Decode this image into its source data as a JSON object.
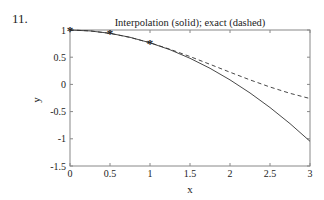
{
  "problem_number": "11.",
  "chart_data": {
    "type": "line",
    "title": "Interpolation (solid); exact (dashed)",
    "xlabel": "x",
    "ylabel": "y",
    "xlim": [
      0,
      3
    ],
    "ylim": [
      -1.5,
      1
    ],
    "xticks": [
      "0",
      "0.5",
      "1",
      "1.5",
      "2",
      "2.5",
      "3"
    ],
    "yticks": [
      "1",
      "0.5",
      "0",
      "-0.5",
      "-1",
      "-1.5"
    ],
    "grid": false,
    "series": [
      {
        "name": "Interpolation",
        "style": "solid",
        "x": [
          0,
          0.25,
          0.5,
          0.75,
          1,
          1.25,
          1.5,
          1.75,
          2,
          2.25,
          2.5,
          2.75,
          3
        ],
        "y": [
          1,
          0.983,
          0.939,
          0.866,
          0.765,
          0.637,
          0.48,
          0.296,
          0.083,
          -0.157,
          -0.425,
          -0.721,
          -1.046
        ]
      },
      {
        "name": "Exact",
        "style": "dashed",
        "x": [
          0,
          0.25,
          0.5,
          0.75,
          1,
          1.25,
          1.5,
          1.75,
          2,
          2.25,
          2.5,
          2.75,
          3
        ],
        "y": [
          1,
          0.984,
          0.938,
          0.864,
          0.765,
          0.646,
          0.512,
          0.369,
          0.224,
          0.083,
          -0.048,
          -0.164,
          -0.26
        ]
      },
      {
        "name": "Data points",
        "style": "markers",
        "marker": "*",
        "x": [
          0,
          0.5,
          1
        ],
        "y": [
          1,
          0.938,
          0.765
        ]
      }
    ]
  }
}
